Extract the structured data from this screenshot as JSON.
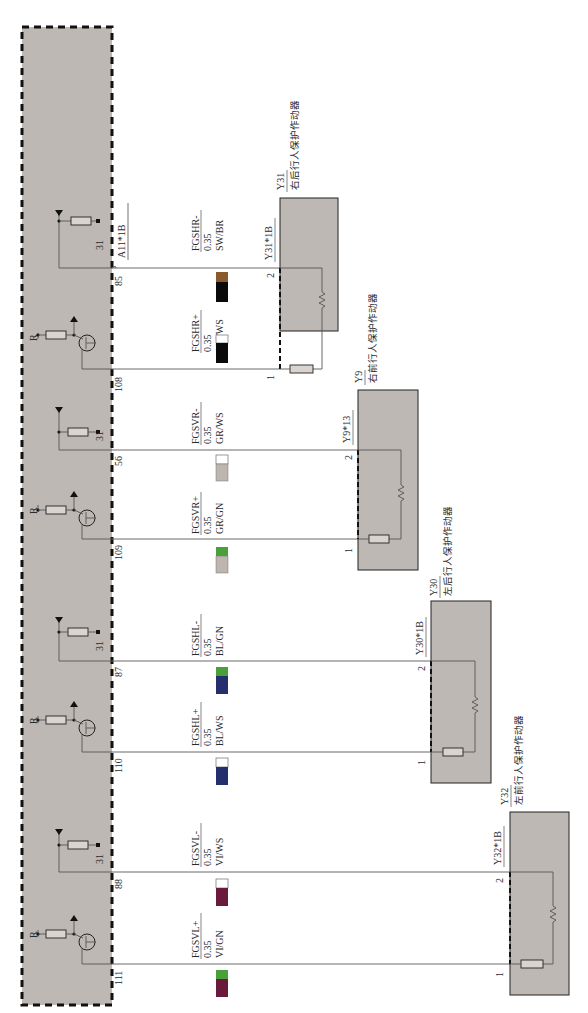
{
  "diagram": {
    "control_unit": {
      "connector": "A11*1B",
      "fill": "#bdb8b3",
      "border": "dashed"
    },
    "circuits": [
      {
        "id": "FGSHR-",
        "pin": "85",
        "gauge": "0.35",
        "color_code": "SW/BR",
        "swatch_top": "#8a5a2b",
        "swatch_bottom": "#0a0a0a",
        "driver": "pull-down resistor to 31",
        "ground_label": "31",
        "y": 268,
        "target_pin": "2"
      },
      {
        "id": "FGSHR+",
        "pin": "108",
        "gauge": "0.35",
        "color_code": "SW/WS",
        "swatch_top": "#ffffff",
        "swatch_bottom": "#0a0a0a",
        "driver": "transistor with R",
        "r_label": "R",
        "y": 369,
        "target_pin": "1"
      },
      {
        "id": "FGSVR-",
        "pin": "56",
        "gauge": "0.35",
        "color_code": "GR/WS",
        "swatch_top": "#ffffff",
        "swatch_bottom": "#bdb5ae",
        "driver": "pull-down resistor to 31",
        "ground_label": "31",
        "y": 450,
        "target_pin": "2"
      },
      {
        "id": "FGSVR+",
        "pin": "109",
        "gauge": "0.35",
        "color_code": "GR/GN",
        "swatch_top": "#4aa038",
        "swatch_bottom": "#bdb5ae",
        "driver": "transistor with R",
        "r_label": "R",
        "y": 539,
        "target_pin": "1"
      },
      {
        "id": "FGSHL-",
        "pin": "87",
        "gauge": "0.35",
        "color_code": "BL/GN",
        "swatch_top": "#4aa038",
        "swatch_bottom": "#262f6e",
        "driver": "pull-down resistor to 31",
        "ground_label": "31",
        "y": 661,
        "target_pin": "2"
      },
      {
        "id": "FGSHL+",
        "pin": "110",
        "gauge": "0.35",
        "color_code": "BL/WS",
        "swatch_top": "#ffffff",
        "swatch_bottom": "#262f6e",
        "driver": "transistor with R",
        "r_label": "R",
        "y": 752,
        "target_pin": "1"
      },
      {
        "id": "FGSVL-",
        "pin": "88",
        "gauge": "0.35",
        "color_code": "VI/WS",
        "swatch_top": "#ffffff",
        "swatch_bottom": "#6a1a3a",
        "driver": "pull-down resistor to 31",
        "ground_label": "31",
        "y": 872,
        "target_pin": "2"
      },
      {
        "id": "FGSVL+",
        "pin": "111",
        "gauge": "0.35",
        "color_code": "VI/GN",
        "swatch_top": "#4aa038",
        "swatch_bottom": "#6a1a3a",
        "driver": "transistor with R",
        "r_label": "R",
        "y": 964,
        "target_pin": "1"
      }
    ],
    "actuators": [
      {
        "ref": "Y31",
        "name": "右后行人保护作动器",
        "connector": "Y31*1B",
        "pin2": "2",
        "pin1": "1"
      },
      {
        "ref": "Y9",
        "name": "右前行人保护作动器",
        "connector": "Y9*13",
        "pin2": "2",
        "pin1": "1"
      },
      {
        "ref": "Y30",
        "name": "左后行人保护作动器",
        "connector": "Y30*1B",
        "pin2": "2",
        "pin1": "1"
      },
      {
        "ref": "Y32",
        "name": "左前行人保护作动器",
        "connector": "Y32*1B",
        "pin2": "2",
        "pin1": "1"
      }
    ]
  }
}
